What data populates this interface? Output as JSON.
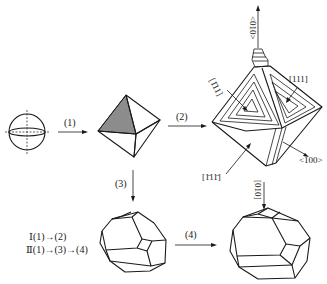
{
  "diagram": {
    "title": "",
    "steps": {
      "step1": "(1)",
      "step2": "(2)",
      "step3": "(3)",
      "step4": "(4)"
    },
    "shapes": [
      {
        "id": "sphere",
        "label": "spherical nucleus"
      },
      {
        "id": "octahedron",
        "label": "octahedron"
      },
      {
        "id": "growth-octahedron",
        "label": "octahedron with stepped growth"
      },
      {
        "id": "truncated-octahedron-small",
        "label": "truncated octahedron"
      },
      {
        "id": "truncated-octahedron-large",
        "label": "truncated octahedron"
      }
    ],
    "directions": {
      "up_arrow": "<010>",
      "face_left": "[1̄11]",
      "face_right": "[111]",
      "face_bottom": "[1̄11̄]",
      "edge_right": "<100>",
      "top_arrow": "[010]"
    },
    "paths": {
      "path1": "Ⅰ(1)→(2)",
      "path2": "Ⅱ(1)→(3)→(4)"
    },
    "colors": {
      "line": "#1a1a1a",
      "shaded_face": "#8c8c8c",
      "background": "#ffffff"
    }
  }
}
